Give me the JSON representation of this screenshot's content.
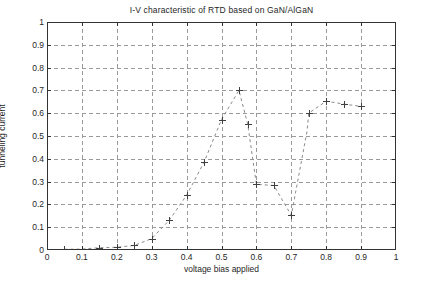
{
  "chart_data": {
    "type": "line",
    "title": "I-V characteristic of RTD based on GaN/AlGaN",
    "xlabel": "voltage bias applied",
    "ylabel": "tunneling current",
    "xlim": [
      0,
      1
    ],
    "ylim": [
      0,
      1
    ],
    "xticks": [
      "0",
      "0.1",
      "0.2",
      "0.3",
      "0.4",
      "0.5",
      "0.6",
      "0.7",
      "0.8",
      "0.9",
      "1"
    ],
    "xtick_values": [
      0,
      0.1,
      0.2,
      0.3,
      0.4,
      0.5,
      0.6,
      0.7,
      0.8,
      0.9,
      1
    ],
    "yticks": [
      "0",
      "0.1",
      "0.2",
      "0.3",
      "0.4",
      "0.5",
      "0.6",
      "0.7",
      "0.8",
      "0.9",
      "1"
    ],
    "ytick_values": [
      0,
      0.1,
      0.2,
      0.3,
      0.4,
      0.5,
      0.6,
      0.7,
      0.8,
      0.9,
      1
    ],
    "grid": true,
    "grid_style": "dashed",
    "grid_color": "#9a9a9a",
    "legend": null,
    "line_style": "dashed",
    "line_color": "#8a8a8a",
    "marker": "plus",
    "marker_color": "#404040",
    "axis_color": "#333333",
    "background": "#ffffff",
    "x": [
      0.05,
      0.1,
      0.15,
      0.2,
      0.25,
      0.3,
      0.35,
      0.4,
      0.45,
      0.5,
      0.55,
      0.575,
      0.6,
      0.65,
      0.7,
      0.745,
      0.75,
      0.8,
      0.85,
      0.9
    ],
    "y": [
      0.003,
      0.004,
      0.01,
      0.012,
      0.02,
      0.05,
      0.13,
      0.24,
      0.385,
      0.572,
      0.7,
      0.553,
      0.288,
      0.283,
      0.152,
      0.52,
      0.6,
      0.653,
      0.64,
      0.63
    ],
    "points": [
      {
        "x": 0.05,
        "y": 0.003
      },
      {
        "x": 0.1,
        "y": 0.004
      },
      {
        "x": 0.15,
        "y": 0.01
      },
      {
        "x": 0.2,
        "y": 0.012
      },
      {
        "x": 0.25,
        "y": 0.02
      },
      {
        "x": 0.3,
        "y": 0.05
      },
      {
        "x": 0.35,
        "y": 0.13
      },
      {
        "x": 0.4,
        "y": 0.24
      },
      {
        "x": 0.45,
        "y": 0.385
      },
      {
        "x": 0.5,
        "y": 0.572
      },
      {
        "x": 0.55,
        "y": 0.7
      },
      {
        "x": 0.575,
        "y": 0.553
      },
      {
        "x": 0.6,
        "y": 0.288
      },
      {
        "x": 0.65,
        "y": 0.283
      },
      {
        "x": 0.7,
        "y": 0.152
      },
      {
        "x": 0.75,
        "y": 0.6
      },
      {
        "x": 0.8,
        "y": 0.653
      },
      {
        "x": 0.85,
        "y": 0.64
      },
      {
        "x": 0.9,
        "y": 0.63
      }
    ]
  }
}
